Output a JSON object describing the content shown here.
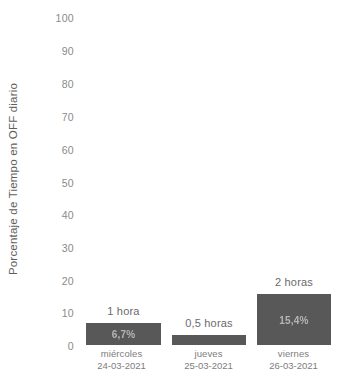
{
  "chart_data": {
    "type": "bar",
    "title": "",
    "subtitle": "",
    "xlabel": "",
    "ylabel": "Porcentaje de Tiempo en OFF diario",
    "ylim": [
      0,
      100
    ],
    "ytick_labels": [
      "100",
      "90",
      "80",
      "70",
      "60",
      "50",
      "40",
      "30",
      "20",
      "10",
      "0"
    ],
    "ytick_values": [
      100,
      90,
      80,
      70,
      60,
      50,
      40,
      30,
      20,
      10,
      0
    ],
    "grid": false,
    "legend": false,
    "legend_position": "none",
    "bar_color": "#585858",
    "categories": [
      "miércoles\n24-03-2021",
      "jueves\n25-03-2021",
      "viernes\n26-03-2021"
    ],
    "category_lines": [
      {
        "day": "miércoles",
        "date": "24-03-2021"
      },
      {
        "day": "jueves",
        "date": "25-03-2021"
      },
      {
        "day": "viernes",
        "date": "26-03-2021"
      }
    ],
    "values": [
      6.7,
      3.0,
      15.4
    ],
    "bar_value_labels": [
      "6,7%",
      "3,1%",
      "15,4%"
    ],
    "annotations": [
      "1 hora",
      "0,5 horas",
      "2 horas"
    ],
    "series": [
      {
        "name": "Porcentaje de Tiempo en OFF diario",
        "values": [
          6.7,
          3.0,
          15.4
        ]
      }
    ]
  }
}
